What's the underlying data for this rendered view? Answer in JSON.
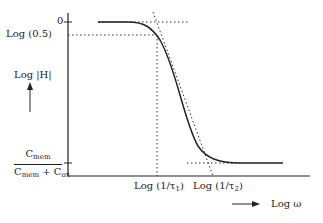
{
  "diagram": {
    "y_axis": {
      "label": "Log |H|",
      "tick_top": "0",
      "tick_half": "Log (0.5)",
      "tick_bottom": {
        "numerator_base": "C",
        "numerator_sub": "mem",
        "denominator_base1": "C",
        "denominator_sub1": "mem",
        "denominator_plus": " + ",
        "denominator_base2": "C",
        "denominator_sub2": "ox"
      }
    },
    "x_axis": {
      "label": "Log ω",
      "tick_1": {
        "base": "Log (1/τ",
        "sub": "1",
        "close": ")"
      },
      "tick_2": {
        "base": "Log (1/τ",
        "sub": "2",
        "close": ")"
      }
    },
    "colors": {
      "line": "#222222",
      "background": "#ffffff"
    }
  }
}
